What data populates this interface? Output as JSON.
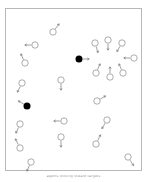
{
  "figure": {
    "caption": "agents moving toward targets",
    "frame": {
      "x": 5,
      "y": 8,
      "w": 137,
      "h": 163,
      "stroke": "#b8b8b8"
    },
    "colors": {
      "agent_stroke": "#8a8a8a",
      "arrow": "#7a7a7a",
      "leader_fill": "#000000"
    },
    "agent_radius": 3.2,
    "arrow_length": 7,
    "agents": [
      {
        "x": 53,
        "y": 32,
        "dx": 0.6,
        "dy": -0.8,
        "type": "follower"
      },
      {
        "x": 35,
        "y": 45,
        "dx": -1,
        "dy": 0,
        "type": "follower"
      },
      {
        "x": 25,
        "y": 63,
        "dx": -0.4,
        "dy": -0.9,
        "type": "follower"
      },
      {
        "x": 95,
        "y": 43,
        "dx": 0.3,
        "dy": 0.95,
        "type": "follower"
      },
      {
        "x": 108,
        "y": 40,
        "dx": 0,
        "dy": 1,
        "type": "follower"
      },
      {
        "x": 122,
        "y": 43,
        "dx": -0.5,
        "dy": 0.85,
        "type": "follower"
      },
      {
        "x": 134,
        "y": 58,
        "dx": -1,
        "dy": 0,
        "type": "follower"
      },
      {
        "x": 96,
        "y": 73,
        "dx": 0.4,
        "dy": -0.9,
        "type": "follower"
      },
      {
        "x": 110,
        "y": 77,
        "dx": 0,
        "dy": -1,
        "type": "follower"
      },
      {
        "x": 123,
        "y": 73,
        "dx": -0.4,
        "dy": -0.9,
        "type": "follower"
      },
      {
        "x": 79,
        "y": 59,
        "dx": 1,
        "dy": 0,
        "type": "leader"
      },
      {
        "x": 61,
        "y": 80,
        "dx": 0,
        "dy": 1,
        "type": "follower"
      },
      {
        "x": 22,
        "y": 83,
        "dx": -0.45,
        "dy": 0.9,
        "type": "follower"
      },
      {
        "x": 27,
        "y": 106,
        "dx": -0.85,
        "dy": -0.5,
        "type": "leader"
      },
      {
        "x": 97,
        "y": 101,
        "dx": 0.85,
        "dy": -0.5,
        "type": "follower"
      },
      {
        "x": 64,
        "y": 121,
        "dx": -1,
        "dy": 0,
        "type": "follower"
      },
      {
        "x": 107,
        "y": 120,
        "dx": -0.5,
        "dy": 0.85,
        "type": "follower"
      },
      {
        "x": 20,
        "y": 124,
        "dx": -0.4,
        "dy": 0.9,
        "type": "follower"
      },
      {
        "x": 61,
        "y": 137,
        "dx": 0,
        "dy": 1,
        "type": "follower"
      },
      {
        "x": 20,
        "y": 148,
        "dx": -0.45,
        "dy": -0.9,
        "type": "follower"
      },
      {
        "x": 96,
        "y": 144,
        "dx": 0.45,
        "dy": -0.9,
        "type": "follower"
      },
      {
        "x": 31,
        "y": 162,
        "dx": -0.4,
        "dy": 0.9,
        "type": "follower"
      },
      {
        "x": 128,
        "y": 157,
        "dx": 0.55,
        "dy": 0.85,
        "type": "follower"
      }
    ]
  }
}
